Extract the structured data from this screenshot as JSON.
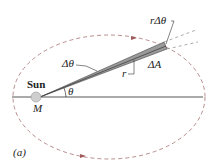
{
  "diagram": {
    "labels": {
      "sun": "Sun",
      "mass": "M",
      "theta": "θ",
      "delta_theta": "Δθ",
      "r": "r",
      "delta_a": "ΔA",
      "r_delta_theta": "rΔθ",
      "panel": "(a)"
    },
    "colors": {
      "orbit": "#a05a5a",
      "wedge": "#9a9a9a",
      "sun": "#c8c8c8",
      "line": "#333333"
    }
  }
}
